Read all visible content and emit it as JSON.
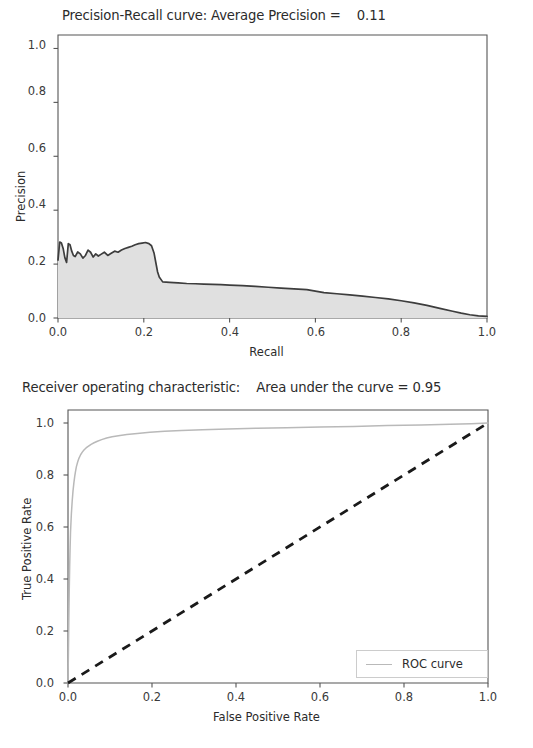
{
  "chart_data": [
    {
      "type": "area",
      "title": "Precision-Recall curve: Average Precision =    0.11",
      "xlabel": "Recall",
      "ylabel": "Precision",
      "xlim": [
        0.0,
        1.0
      ],
      "ylim": [
        0.0,
        1.05
      ],
      "xticks": [
        "0.0",
        "0.2",
        "0.4",
        "0.6",
        "0.8",
        "1.0"
      ],
      "xtick_values": [
        0.0,
        0.2,
        0.4,
        0.6,
        0.8,
        1.0
      ],
      "yticks": [
        "0.0",
        "0.2",
        "0.4",
        "0.6",
        "0.8",
        "1.0"
      ],
      "ytick_values": [
        0.0,
        0.2,
        0.4,
        0.6,
        0.8,
        1.0
      ],
      "grid": false,
      "legend": null,
      "line_color": "#3d3d3d",
      "fill_color": "#e0e0e0",
      "annotations": [
        "Average Precision = 0.11"
      ],
      "series": [
        {
          "name": "Precision-Recall",
          "x": [
            0.0,
            0.004,
            0.008,
            0.012,
            0.016,
            0.02,
            0.024,
            0.028,
            0.032,
            0.036,
            0.04,
            0.046,
            0.052,
            0.058,
            0.064,
            0.07,
            0.076,
            0.082,
            0.088,
            0.094,
            0.1,
            0.108,
            0.116,
            0.124,
            0.132,
            0.14,
            0.148,
            0.156,
            0.164,
            0.172,
            0.18,
            0.188,
            0.196,
            0.204,
            0.212,
            0.218,
            0.224,
            0.228,
            0.232,
            0.236,
            0.244,
            0.26,
            0.28,
            0.3,
            0.32,
            0.34,
            0.36,
            0.38,
            0.4,
            0.43,
            0.46,
            0.49,
            0.52,
            0.55,
            0.58,
            0.6,
            0.62,
            0.65,
            0.68,
            0.71,
            0.74,
            0.77,
            0.8,
            0.83,
            0.86,
            0.89,
            0.92,
            0.94,
            0.96,
            0.98,
            1.0
          ],
          "y": [
            0.215,
            0.282,
            0.278,
            0.258,
            0.224,
            0.206,
            0.276,
            0.272,
            0.248,
            0.232,
            0.228,
            0.245,
            0.238,
            0.222,
            0.232,
            0.252,
            0.244,
            0.226,
            0.238,
            0.23,
            0.236,
            0.244,
            0.232,
            0.24,
            0.248,
            0.244,
            0.252,
            0.258,
            0.262,
            0.266,
            0.272,
            0.276,
            0.278,
            0.28,
            0.276,
            0.268,
            0.24,
            0.206,
            0.172,
            0.152,
            0.134,
            0.132,
            0.13,
            0.128,
            0.127,
            0.126,
            0.125,
            0.124,
            0.122,
            0.12,
            0.117,
            0.114,
            0.111,
            0.108,
            0.105,
            0.1,
            0.094,
            0.09,
            0.086,
            0.081,
            0.076,
            0.071,
            0.064,
            0.056,
            0.047,
            0.036,
            0.025,
            0.018,
            0.012,
            0.008,
            0.006
          ]
        }
      ]
    },
    {
      "type": "line",
      "title": "Receiver operating characteristic:    Area under the curve = 0.95",
      "xlabel": "False Positive Rate",
      "ylabel": "True Positive Rate",
      "xlim": [
        0.0,
        1.0
      ],
      "ylim": [
        0.0,
        1.05
      ],
      "xticks": [
        "0.0",
        "0.2",
        "0.4",
        "0.6",
        "0.8",
        "1.0"
      ],
      "xtick_values": [
        0.0,
        0.2,
        0.4,
        0.6,
        0.8,
        1.0
      ],
      "yticks": [
        "0.0",
        "0.2",
        "0.4",
        "0.6",
        "0.8",
        "1.0"
      ],
      "ytick_values": [
        0.0,
        0.2,
        0.4,
        0.6,
        0.8,
        1.0
      ],
      "grid": false,
      "legend_position": "lower right",
      "annotations": [
        "Area under the curve = 0.95"
      ],
      "legend_entries": [
        {
          "label": "ROC curve",
          "color": "#b9b9b9",
          "style": "solid"
        }
      ],
      "series": [
        {
          "name": "ROC curve",
          "color": "#b9b9b9",
          "style": "solid",
          "x": [
            0.0,
            0.001,
            0.002,
            0.003,
            0.004,
            0.005,
            0.006,
            0.008,
            0.01,
            0.012,
            0.014,
            0.016,
            0.018,
            0.02,
            0.023,
            0.026,
            0.03,
            0.034,
            0.038,
            0.043,
            0.048,
            0.055,
            0.062,
            0.07,
            0.08,
            0.092,
            0.105,
            0.12,
            0.14,
            0.165,
            0.195,
            0.23,
            0.27,
            0.32,
            0.38,
            0.45,
            0.52,
            0.6,
            0.68,
            0.76,
            0.84,
            0.91,
            0.96,
            1.0
          ],
          "y": [
            0.0,
            0.12,
            0.25,
            0.36,
            0.45,
            0.52,
            0.58,
            0.65,
            0.7,
            0.74,
            0.77,
            0.795,
            0.815,
            0.832,
            0.85,
            0.864,
            0.878,
            0.888,
            0.896,
            0.904,
            0.91,
            0.918,
            0.924,
            0.93,
            0.936,
            0.942,
            0.947,
            0.951,
            0.956,
            0.96,
            0.964,
            0.968,
            0.971,
            0.974,
            0.977,
            0.98,
            0.982,
            0.985,
            0.987,
            0.99,
            0.992,
            0.995,
            0.997,
            1.0
          ]
        },
        {
          "name": "chance-diagonal",
          "color": "#1a1a1a",
          "style": "dashed",
          "x": [
            0.0,
            1.0
          ],
          "y": [
            0.0,
            1.0
          ]
        }
      ]
    }
  ],
  "pr_chart": {
    "title": "Precision-Recall curve: Average Precision =    0.11",
    "xlabel": "Recall",
    "ylabel": "Precision",
    "xticks": [
      "0.0",
      "0.2",
      "0.4",
      "0.6",
      "0.8",
      "1.0"
    ],
    "yticks": [
      "0.0",
      "0.2",
      "0.4",
      "0.6",
      "0.8",
      "1.0"
    ]
  },
  "roc_chart": {
    "title": "Receiver operating characteristic:    Area under the curve = 0.95",
    "xlabel": "False Positive Rate",
    "ylabel": "True Positive Rate",
    "xticks": [
      "0.0",
      "0.2",
      "0.4",
      "0.6",
      "0.8",
      "1.0"
    ],
    "yticks": [
      "0.0",
      "0.2",
      "0.4",
      "0.6",
      "0.8",
      "1.0"
    ],
    "legend_label": "ROC curve"
  },
  "colors": {
    "pr_line": "#3d3d3d",
    "pr_fill": "#e0e0e0",
    "roc_line": "#b9b9b9",
    "diagonal": "#1a1a1a",
    "axis": "#555555",
    "text": "#2b2b2b",
    "background": "#ffffff"
  }
}
